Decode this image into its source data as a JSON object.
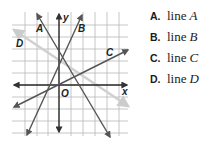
{
  "graph": {
    "axis_labels": {
      "x": "x",
      "y": "y",
      "origin": "O"
    },
    "line_labels": [
      "A",
      "B",
      "C",
      "D"
    ],
    "grid": {
      "cols": 9,
      "rows": 10
    }
  },
  "choices": [
    {
      "letter": "A.",
      "text": "line",
      "var": "A"
    },
    {
      "letter": "B.",
      "text": "line",
      "var": "B"
    },
    {
      "letter": "C.",
      "text": "line",
      "var": "C"
    },
    {
      "letter": "D.",
      "text": "line",
      "var": "D"
    }
  ]
}
